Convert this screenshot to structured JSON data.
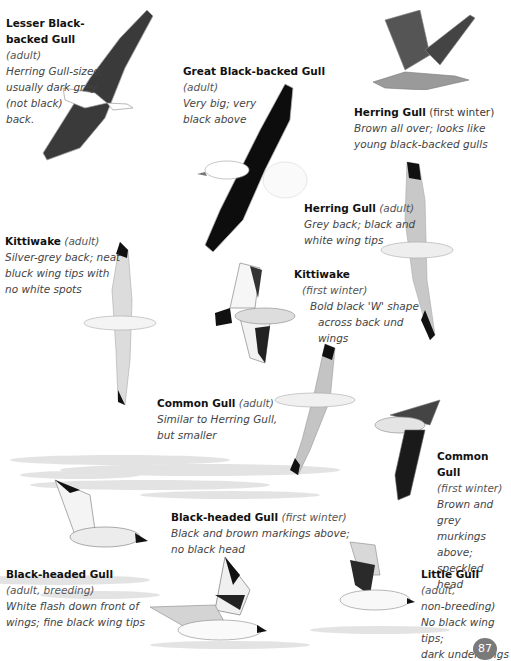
{
  "page": {
    "page_number": "87",
    "colors": {
      "text": "#111111",
      "italic_text": "#444444",
      "page_badge": "#7a7a7a"
    }
  },
  "entries": [
    {
      "name": "Lesser Black-backed Gull",
      "note": "(adult)",
      "desc": [
        "Herring Gull-sized;",
        "usually dark grey",
        "(not black)",
        "back."
      ]
    },
    {
      "name": "Great Black-backed Gull",
      "note": "(adult)",
      "desc": [
        "Very big; very",
        "black above"
      ]
    },
    {
      "name": "Herring Gull",
      "note": "(first winter)",
      "desc": [
        "Brown all over; looks like",
        "young black-backed gulls"
      ]
    },
    {
      "name": "Herring Gull",
      "note": "(adult)",
      "desc": [
        "Grey back; black and",
        "white wing tips"
      ]
    },
    {
      "name": "Kittiwake",
      "note": "(adult)",
      "desc": [
        "Silver-grey back; neat",
        "bluck wing tips with",
        "no white spots"
      ]
    },
    {
      "name": "Kittiwake",
      "note": "(first winter)",
      "desc": [
        "Bold black 'W' shape",
        "across back und wings"
      ]
    },
    {
      "name": "Common Gull",
      "note": "(adult)",
      "desc": [
        "Similar to Herring Gull,",
        "but smaller"
      ]
    },
    {
      "name": "Common Gull",
      "note": "(first winter)",
      "desc": [
        "Brown and grey",
        "murkings above;",
        "speckled head"
      ]
    },
    {
      "name": "Black-headed Gull",
      "note": "(first winter)",
      "desc": [
        "Black and brown markings above;",
        "no black head"
      ]
    },
    {
      "name": "Black-headed Gull",
      "note": "(adult, breeding)",
      "desc": [
        "White flash down front of",
        "wings; fine black wing tips"
      ]
    },
    {
      "name": "Little Gull",
      "note": "(adult,",
      "note2": "non-breeding)",
      "desc": [
        "No black wing tips;",
        "dark underwings"
      ]
    }
  ]
}
